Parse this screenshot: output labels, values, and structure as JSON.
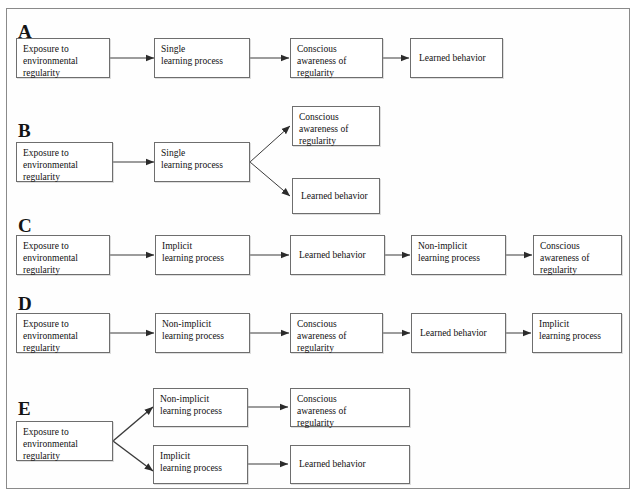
{
  "figure": {
    "border_color": "#8a8a8a",
    "background": "#ffffff",
    "box_border_color": "#6e6e6e",
    "arrow_color": "#2b2b2b"
  },
  "labels": {
    "exposure": "Exposure to\nenvironmental\nregularity",
    "single_learning": "Single\nlearning process",
    "conscious_awareness": "Conscious\nawareness of\nregularity",
    "learned_behavior": "Learned behavior",
    "implicit_learning": "Implicit\nlearning process",
    "non_implicit_learning": "Non-implicit\nlearning process"
  },
  "panels": [
    {
      "id": "A",
      "letter": "A",
      "nodes": [
        {
          "name": "exposure",
          "text": "Exposure to\nenvironmental\nregularity"
        },
        {
          "name": "single-learning-process",
          "text": "Single\nlearning process"
        },
        {
          "name": "conscious-awareness",
          "text": "Conscious\nawareness of\nregularity"
        },
        {
          "name": "learned-behavior",
          "text": "Learned behavior"
        }
      ]
    },
    {
      "id": "B",
      "letter": "B",
      "nodes": [
        {
          "name": "exposure",
          "text": "Exposure to\nenvironmental\nregularity"
        },
        {
          "name": "single-learning-process",
          "text": "Single\nlearning process"
        },
        {
          "name": "conscious-awareness",
          "text": "Conscious\nawareness of\nregularity"
        },
        {
          "name": "learned-behavior",
          "text": "Learned behavior"
        }
      ]
    },
    {
      "id": "C",
      "letter": "C",
      "nodes": [
        {
          "name": "exposure",
          "text": "Exposure to\nenvironmental\nregularity"
        },
        {
          "name": "implicit-learning-process",
          "text": "Implicit\nlearning process"
        },
        {
          "name": "learned-behavior",
          "text": "Learned behavior"
        },
        {
          "name": "non-implicit-learning-process",
          "text": "Non-implicit\nlearning process"
        },
        {
          "name": "conscious-awareness",
          "text": "Conscious\nawareness of\nregularity"
        }
      ]
    },
    {
      "id": "D",
      "letter": "D",
      "nodes": [
        {
          "name": "exposure",
          "text": "Exposure to\nenvironmental\nregularity"
        },
        {
          "name": "non-implicit-learning-process",
          "text": "Non-implicit\nlearning process"
        },
        {
          "name": "conscious-awareness",
          "text": "Conscious\nawareness of\nregularity"
        },
        {
          "name": "learned-behavior",
          "text": "Learned behavior"
        },
        {
          "name": "implicit-learning-process",
          "text": "Implicit\nlearning process"
        }
      ]
    },
    {
      "id": "E",
      "letter": "E",
      "nodes": [
        {
          "name": "exposure",
          "text": "Exposure to\nenvironmental\nregularity"
        },
        {
          "name": "non-implicit-learning-process",
          "text": "Non-implicit\nlearning process"
        },
        {
          "name": "conscious-awareness",
          "text": "Conscious\nawareness of\nregularity"
        },
        {
          "name": "implicit-learning-process",
          "text": "Implicit\nlearning process"
        },
        {
          "name": "learned-behavior",
          "text": "Learned behavior"
        }
      ]
    }
  ]
}
